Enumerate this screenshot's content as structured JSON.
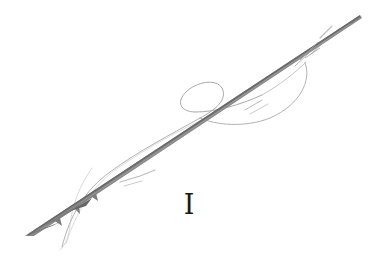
{
  "illustration": {
    "subject": "sketched barbed spear with decorative flourish",
    "numeral": "I",
    "colors": {
      "background": "#ffffff",
      "shaft": "#7a7a7a",
      "shaft_dark": "#555555",
      "flourish": "#a8a8a8",
      "text": "#1a1a1a"
    }
  }
}
